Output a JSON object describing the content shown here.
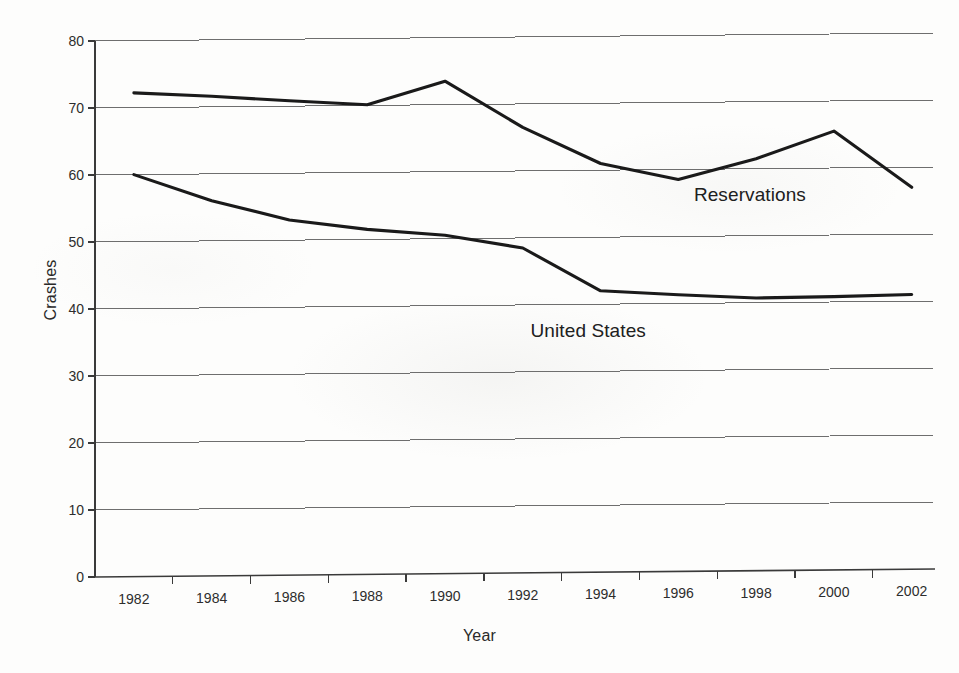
{
  "chart_data": {
    "type": "line",
    "title": "",
    "xlabel": "Year",
    "ylabel": "Crashes",
    "xlim": [
      1981,
      1982.5
    ],
    "ylim": [
      0,
      80
    ],
    "yticks": [
      0,
      10,
      20,
      30,
      40,
      50,
      60,
      70,
      80
    ],
    "ytick_labels": [
      "0",
      "10",
      "20",
      "30",
      "40",
      "50",
      "60",
      "70",
      "80"
    ],
    "xticks": [
      1982,
      1984,
      1986,
      1988,
      1990,
      1992,
      1994,
      1996,
      1998,
      2000,
      2002
    ],
    "xtick_labels": [
      "1982",
      "1984",
      "1986",
      "1988",
      "1990",
      "1992",
      "1994",
      "1996",
      "1998",
      "2000",
      "2002"
    ],
    "grid": true,
    "grid_axis": "y",
    "legend": "inline-annotations",
    "x": [
      1982,
      1984,
      1986,
      1988,
      1990,
      1992,
      1994,
      1996,
      1998,
      2000,
      2002
    ],
    "series": [
      {
        "name": "Reservations",
        "color": "#1a1a1a",
        "values": [
          72.2,
          71.6,
          70.8,
          70.1,
          73.5,
          66.5,
          61.0,
          58.5,
          61.5,
          65.5,
          57.0
        ]
      },
      {
        "name": "United States",
        "color": "#1a1a1a",
        "values": [
          60.0,
          56.0,
          53.0,
          51.5,
          50.5,
          48.5,
          42.0,
          41.3,
          40.7,
          40.8,
          41.0
        ]
      }
    ],
    "annotations": [
      {
        "text": "Reservations",
        "x": 1996.4,
        "y": 56.0
      },
      {
        "text": "United States",
        "x": 1992.2,
        "y": 36.0
      }
    ]
  }
}
